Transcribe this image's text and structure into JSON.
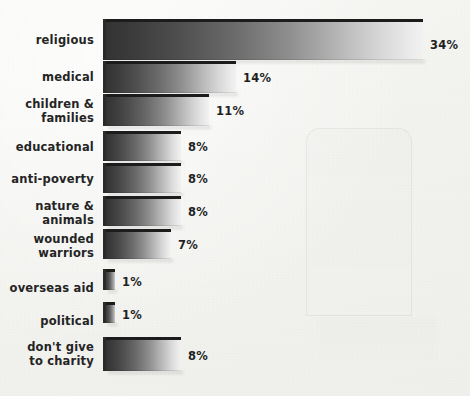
{
  "chart_data": {
    "type": "bar",
    "orientation": "horizontal",
    "title": "",
    "subtitle": "",
    "xlabel": "",
    "ylabel": "",
    "xlim": [
      0,
      34
    ],
    "grid": false,
    "legend": null,
    "value_suffix": "%",
    "categories": [
      "religious",
      "medical",
      "children &\nfamilies",
      "educational",
      "anti-poverty",
      "nature &\nanimals",
      "wounded\nwarriors",
      "overseas aid",
      "political",
      "don't give\nto charity"
    ],
    "values": [
      34,
      14,
      11,
      8,
      8,
      8,
      7,
      1,
      1,
      8
    ],
    "value_labels": [
      "34%",
      "14%",
      "11%",
      "8%",
      "8%",
      "8%",
      "7%",
      "1%",
      "1%",
      "8%"
    ],
    "colors": {
      "background": "#f2f2ef",
      "bar_gradient_start": "#333333",
      "bar_gradient_end": "#f1f1f1",
      "bar_bevel": "#1c1c1c",
      "label_text": "#242424",
      "value_text": "#1f1f1f"
    }
  },
  "rows": [
    {
      "label": "religious",
      "value_label": "34%",
      "value": 34,
      "top": 22,
      "height": 38,
      "label_top": 34,
      "value_top": 39
    },
    {
      "label": "medical",
      "value_label": "14%",
      "value": 14,
      "top": 64,
      "height": 29,
      "label_top": 71,
      "value_top": 72
    },
    {
      "label": "children &\nfamilies",
      "value_label": "11%",
      "value": 11,
      "top": 97,
      "height": 29,
      "label_top": 98,
      "value_top": 105
    },
    {
      "label": "educational",
      "value_label": "8%",
      "value": 8,
      "top": 134,
      "height": 27,
      "label_top": 141,
      "value_top": 141
    },
    {
      "label": "anti-poverty",
      "value_label": "8%",
      "value": 8,
      "top": 166,
      "height": 27,
      "label_top": 173,
      "value_top": 173
    },
    {
      "label": "nature &\nanimals",
      "value_label": "8%",
      "value": 8,
      "top": 199,
      "height": 27,
      "label_top": 200,
      "value_top": 206
    },
    {
      "label": "wounded\nwarriors",
      "value_label": "7%",
      "value": 7,
      "top": 232,
      "height": 27,
      "label_top": 233,
      "value_top": 239
    },
    {
      "label": "overseas aid",
      "value_label": "1%",
      "value": 1,
      "top": 272,
      "height": 18,
      "label_top": 282,
      "value_top": 276
    },
    {
      "label": "political",
      "value_label": "1%",
      "value": 1,
      "top": 305,
      "height": 18,
      "label_top": 315,
      "value_top": 309
    },
    {
      "label": "don't give\nto charity",
      "value_label": "8%",
      "value": 8,
      "top": 340,
      "height": 31,
      "label_top": 341,
      "value_top": 350
    }
  ],
  "geometry": {
    "bar_origin_x": 106,
    "px_per_unit": 9.32,
    "value_gap": 7
  }
}
